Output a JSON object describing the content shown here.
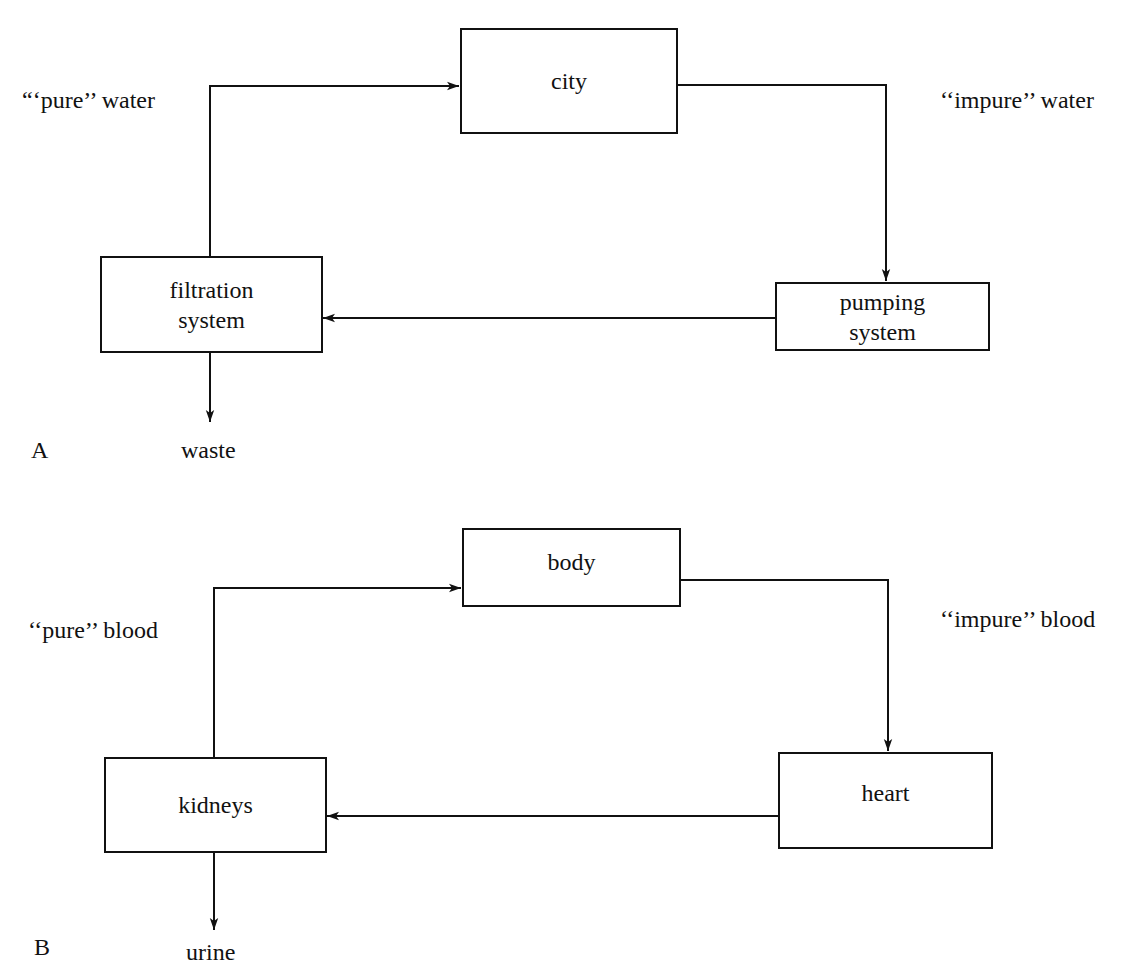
{
  "panels": [
    {
      "label": "A",
      "nodes": {
        "top": "city",
        "left": [
          "filtration",
          "system"
        ],
        "right": [
          "pumping",
          "system"
        ],
        "output": "waste"
      },
      "flows": {
        "left_up": "“‘pure’’ water",
        "right_down": "‘‘impure’’ water"
      }
    },
    {
      "label": "B",
      "nodes": {
        "top": "body",
        "left": [
          "kidneys"
        ],
        "right": [
          "heart"
        ],
        "output": "urine"
      },
      "flows": {
        "left_up": "‘‘pure’’ blood",
        "right_down": "‘‘impure’’ blood"
      }
    }
  ],
  "colors": {
    "stroke": "#111111",
    "background": "#ffffff"
  }
}
